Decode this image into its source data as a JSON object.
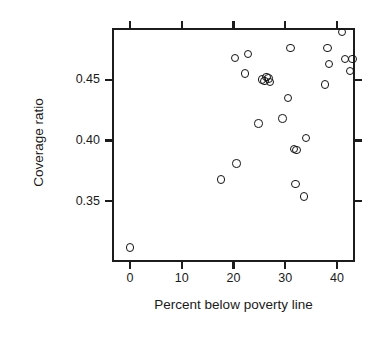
{
  "chart_data": {
    "type": "scatter",
    "title": "",
    "xlabel": "Percent below poverty line",
    "ylabel": "Coverage ratio",
    "xlim": [
      -3.5,
      43.5
    ],
    "ylim": [
      0.3,
      0.4925
    ],
    "grid": false,
    "legend": null,
    "xticks": [
      0,
      10,
      20,
      30,
      40
    ],
    "xtick_labels": [
      "0",
      "10",
      "20",
      "30",
      "40"
    ],
    "yticks": [
      0.35,
      0.4,
      0.45
    ],
    "ytick_labels": [
      "0.35",
      "0.40",
      "0.45"
    ],
    "marker": "open-circle",
    "marker_color": "#141414",
    "n_points": 27,
    "x": [
      0.0,
      17.6,
      20.3,
      20.6,
      22.2,
      22.8,
      24.8,
      25.5,
      26.0,
      26.4,
      26.8,
      27.0,
      29.5,
      30.5,
      31.0,
      31.7,
      32.0,
      32.2,
      33.6,
      34.0,
      37.7,
      38.2,
      38.5,
      41.0,
      41.6,
      42.5,
      43.0
    ],
    "y": [
      0.312,
      0.368,
      0.468,
      0.381,
      0.455,
      0.471,
      0.414,
      0.45,
      0.449,
      0.452,
      0.451,
      0.448,
      0.418,
      0.435,
      0.476,
      0.393,
      0.364,
      0.392,
      0.354,
      0.402,
      0.446,
      0.476,
      0.463,
      0.489,
      0.467,
      0.457,
      0.467
    ],
    "points": [
      {
        "x": 0.0,
        "y": 0.312
      },
      {
        "x": 17.6,
        "y": 0.368
      },
      {
        "x": 20.3,
        "y": 0.468
      },
      {
        "x": 20.6,
        "y": 0.381
      },
      {
        "x": 22.2,
        "y": 0.455
      },
      {
        "x": 22.8,
        "y": 0.471
      },
      {
        "x": 24.8,
        "y": 0.414
      },
      {
        "x": 25.5,
        "y": 0.45
      },
      {
        "x": 26.0,
        "y": 0.449
      },
      {
        "x": 26.4,
        "y": 0.452
      },
      {
        "x": 26.8,
        "y": 0.451
      },
      {
        "x": 27.0,
        "y": 0.448
      },
      {
        "x": 29.5,
        "y": 0.418
      },
      {
        "x": 30.5,
        "y": 0.435
      },
      {
        "x": 31.0,
        "y": 0.476
      },
      {
        "x": 31.7,
        "y": 0.393
      },
      {
        "x": 32.0,
        "y": 0.364
      },
      {
        "x": 32.2,
        "y": 0.392
      },
      {
        "x": 33.6,
        "y": 0.354
      },
      {
        "x": 34.0,
        "y": 0.402
      },
      {
        "x": 37.7,
        "y": 0.446
      },
      {
        "x": 38.2,
        "y": 0.476
      },
      {
        "x": 38.5,
        "y": 0.463
      },
      {
        "x": 41.0,
        "y": 0.489
      },
      {
        "x": 41.6,
        "y": 0.467
      },
      {
        "x": 42.5,
        "y": 0.457
      },
      {
        "x": 43.0,
        "y": 0.467
      }
    ]
  }
}
